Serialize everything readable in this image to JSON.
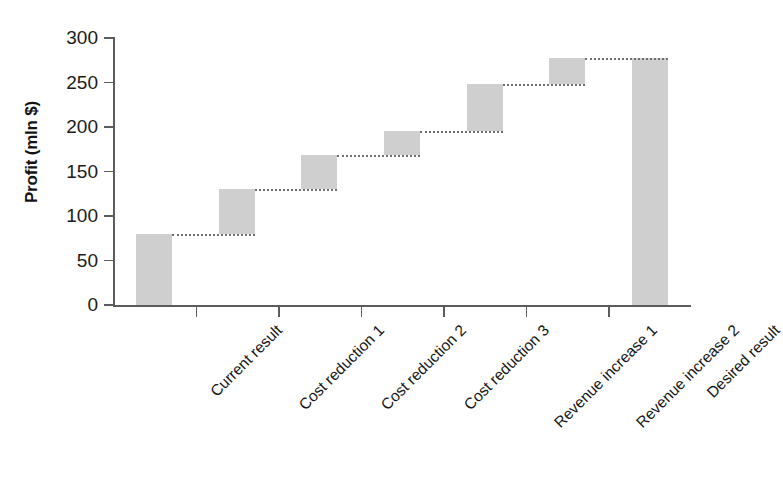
{
  "chart_data": {
    "type": "bar",
    "subtype": "waterfall",
    "title": "",
    "xlabel": "",
    "ylabel": "Profit (mln $)",
    "ylim": [
      0,
      300
    ],
    "yticks": [
      0,
      50,
      100,
      150,
      200,
      250,
      300
    ],
    "ytick_labels": [
      "0",
      "50",
      "100",
      "150",
      "200",
      "250",
      "300"
    ],
    "grid": false,
    "legend": false,
    "categories": [
      "Current result",
      "Cost reduction 1",
      "Cost reduction 2",
      "Cost reduction 3",
      "Revenue increase 1",
      "Revenue increase 2",
      "Desired result"
    ],
    "bar_color": "#cfcfcf",
    "connector_style": "dotted",
    "connector_color": "#6f6f6f",
    "axis_color": "#5c5c5c",
    "bars": [
      {
        "label": "Current result",
        "base": 0,
        "top": 80,
        "delta": 80,
        "kind": "total"
      },
      {
        "label": "Cost reduction 1",
        "base": 80,
        "top": 130,
        "delta": 50,
        "kind": "increase"
      },
      {
        "label": "Cost reduction 2",
        "base": 130,
        "top": 168,
        "delta": 38,
        "kind": "increase"
      },
      {
        "label": "Cost reduction 3",
        "base": 168,
        "top": 196,
        "delta": 28,
        "kind": "increase"
      },
      {
        "label": "Revenue increase 1",
        "base": 196,
        "top": 248,
        "delta": 52,
        "kind": "increase"
      },
      {
        "label": "Revenue increase 2",
        "base": 248,
        "top": 277,
        "delta": 29,
        "kind": "increase"
      },
      {
        "label": "Desired result",
        "base": 0,
        "top": 277,
        "delta": 277,
        "kind": "total"
      }
    ],
    "values": [
      80,
      130,
      168,
      196,
      248,
      277,
      277
    ]
  }
}
